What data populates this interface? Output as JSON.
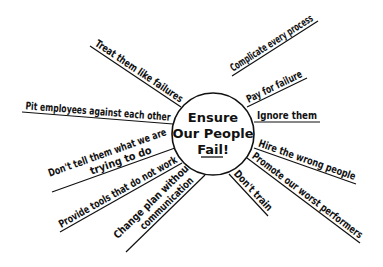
{
  "center": {
    "lines": [
      "Ensure",
      "Our People",
      "Fail!"
    ],
    "underlined_word": "Fail!",
    "cx": 213,
    "cy": 134,
    "r": 41
  },
  "colors": {
    "ink": "#111111",
    "background": "#ffffff"
  },
  "spokes": [
    {
      "id": "treat-them-like-failures",
      "text": "Treat them like failures",
      "x1": 90,
      "y1": 46,
      "x2": 181,
      "y2": 107
    },
    {
      "id": "pit-employees",
      "text": "Pit employees against each other",
      "x1": 22,
      "y1": 112,
      "x2": 173,
      "y2": 124
    },
    {
      "id": "dont-tell-them",
      "text": "Don't tell them what we are",
      "text2": "trying to do",
      "x1": 52,
      "y1": 192,
      "x2": 175,
      "y2": 148
    },
    {
      "id": "provide-tools",
      "text": "Provide tools that do not work",
      "x1": 60,
      "y1": 232,
      "x2": 182,
      "y2": 163
    },
    {
      "id": "change-plan",
      "text": "Change plan without",
      "text2": "communication",
      "x1": 126,
      "y1": 252,
      "x2": 205,
      "y2": 175
    },
    {
      "id": "complicate-every-process",
      "text": "Complicate every process",
      "x1": 232,
      "y1": 76,
      "x2": 318,
      "y2": 21
    },
    {
      "id": "pay-for-failure",
      "text": "Pay for failure",
      "x1": 247,
      "y1": 107,
      "x2": 307,
      "y2": 78
    },
    {
      "id": "ignore-them",
      "text": "Ignore them",
      "x1": 254,
      "y1": 122,
      "x2": 320,
      "y2": 122
    },
    {
      "id": "hire-wrong-people",
      "text": "Hire the wrong people",
      "x1": 254,
      "y1": 148,
      "x2": 356,
      "y2": 184
    },
    {
      "id": "promote-worst",
      "text": "Promote our worst performers",
      "x1": 247,
      "y1": 158,
      "x2": 360,
      "y2": 243
    },
    {
      "id": "dont-train",
      "text": "Don't train",
      "x1": 229,
      "y1": 174,
      "x2": 268,
      "y2": 216
    }
  ]
}
